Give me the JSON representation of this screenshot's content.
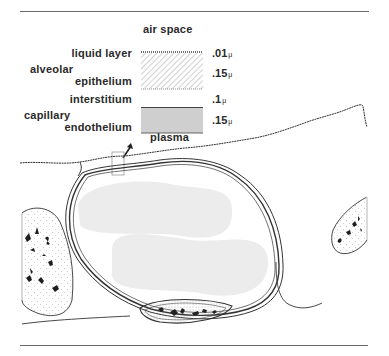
{
  "figure": {
    "type": "alveolar-capillary membrane cross-section",
    "legend": {
      "top_label": "air space",
      "bottom_label": "plasma",
      "layers": [
        {
          "name": "liquid layer",
          "thickness": ".01",
          "unit": "μ",
          "pattern": "dotted-line"
        },
        {
          "name_line1": "alveolar",
          "name_line2": "epithelium",
          "thickness": ".15",
          "unit": "μ",
          "pattern": "hatched"
        },
        {
          "name": "interstitium",
          "thickness": ".1",
          "unit": "μ",
          "pattern": "blank"
        },
        {
          "name_line1": "capillary",
          "name_line2": "endothelium",
          "thickness": ".15",
          "unit": "μ",
          "pattern": "gray-fill"
        }
      ]
    },
    "colors": {
      "line": "#2a2a2a",
      "rule": "#6a6a6a",
      "endothelium_fill": "#cfcfcf",
      "rbc_fill": "#ececec",
      "background": "#ffffff"
    }
  }
}
